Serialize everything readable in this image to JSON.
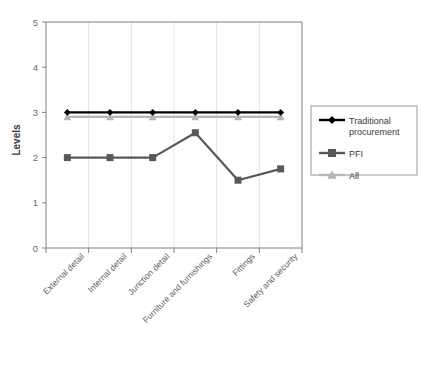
{
  "chart_data": {
    "type": "line",
    "title": "",
    "xlabel": "",
    "ylabel": "Levels",
    "ylim": [
      0,
      5
    ],
    "ytick_labels": [
      "0",
      "1",
      "2",
      "3",
      "4",
      "5"
    ],
    "ytick_values": [
      0,
      1,
      2,
      3,
      4,
      5
    ],
    "grid": true,
    "grid_axis": "x",
    "legend_position": "right",
    "categories": [
      "External detail",
      "Internal detail",
      "Junction detail",
      "Furniture and furnishings",
      "Fittings",
      "Safety and security"
    ],
    "series": [
      {
        "name": "Traditional procurement",
        "marker": "diamond",
        "color": "#000000",
        "values": [
          3.0,
          3.0,
          3.0,
          3.0,
          3.0,
          3.0
        ]
      },
      {
        "name": "PFI",
        "marker": "square",
        "color": "#595959",
        "values": [
          2.0,
          2.0,
          2.0,
          2.55,
          1.5,
          1.75
        ]
      },
      {
        "name": "All",
        "marker": "triangle",
        "color": "#b5b5b5",
        "values": [
          2.9,
          2.9,
          2.9,
          2.9,
          2.9,
          2.9
        ]
      }
    ]
  },
  "legend": {
    "entries": [
      {
        "label": "Traditional procurement",
        "color": "#000000",
        "marker": "diamond"
      },
      {
        "label": "PFI",
        "color": "#595959",
        "marker": "square"
      },
      {
        "label": "All",
        "color": "#b5b5b5",
        "marker": "triangle"
      }
    ]
  },
  "colors": {
    "plot_border": "#808080",
    "gridline": "#e2e2e2",
    "axis_text": "#6a6a6a",
    "background": "#ffffff"
  }
}
